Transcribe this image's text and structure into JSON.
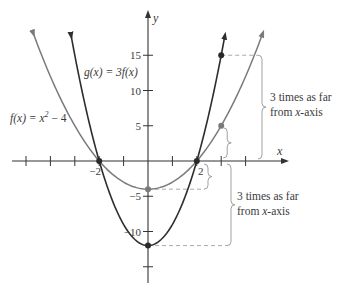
{
  "chart_data": {
    "type": "line",
    "title": "",
    "xlabel": "x",
    "ylabel": "y",
    "xlim": [
      -6,
      7.5
    ],
    "ylim": [
      -17,
      20
    ],
    "x_ticks": [
      -5,
      -4,
      -3,
      -2,
      -1,
      1,
      2,
      3,
      4
    ],
    "x_tick_labels": [
      {
        "value": -2,
        "label": "−2"
      },
      {
        "value": 2,
        "label": "2"
      }
    ],
    "y_ticks": [
      -15,
      -10,
      -5,
      5,
      10,
      15
    ],
    "y_tick_labels": [
      {
        "value": 15,
        "label": "15"
      },
      {
        "value": 10,
        "label": "10"
      },
      {
        "value": 5,
        "label": "5"
      },
      {
        "value": -5,
        "label": "−5"
      },
      {
        "value": -10,
        "label": "−10"
      }
    ],
    "grid": false,
    "series": [
      {
        "name": "f(x) = x² − 4",
        "label_parts": {
          "lhs": "f(x) = x",
          "exp": "2",
          "rhs": " − 4"
        },
        "formula": "x^2 - 4",
        "color": "#7a7a7a",
        "x_range": [
          -4.7,
          4.7
        ],
        "points": [
          [
            -4.7,
            18.09
          ],
          [
            -4,
            12
          ],
          [
            -3,
            5
          ],
          [
            -2,
            0
          ],
          [
            -1,
            -3
          ],
          [
            0,
            -4
          ],
          [
            1,
            -3
          ],
          [
            2,
            0
          ],
          [
            3,
            5
          ],
          [
            4,
            12
          ],
          [
            4.7,
            18.09
          ]
        ]
      },
      {
        "name": "g(x) = 3f(x)",
        "label_parts": {
          "lhs": "g(x) = 3f(x)"
        },
        "formula": "3*(x^2 - 4)",
        "color": "#2e2e2e",
        "x_range": [
          -3.15,
          3.15
        ],
        "points": [
          [
            -3.15,
            17.77
          ],
          [
            -3,
            15
          ],
          [
            -2,
            0
          ],
          [
            -1,
            -9
          ],
          [
            0,
            -12
          ],
          [
            1,
            -9
          ],
          [
            2,
            0
          ],
          [
            3,
            15
          ],
          [
            3.15,
            17.77
          ]
        ]
      }
    ],
    "highlighted_points": [
      {
        "x": -2,
        "y": 0,
        "series": "both"
      },
      {
        "x": 2,
        "y": 0,
        "series": "both"
      },
      {
        "x": 0,
        "y": -4,
        "series": "f"
      },
      {
        "x": 0,
        "y": -12,
        "series": "g"
      },
      {
        "x": 3,
        "y": 5,
        "series": "f"
      },
      {
        "x": 3,
        "y": 15,
        "series": "g"
      }
    ],
    "annotations": [
      {
        "text_line1": "3 times as far",
        "text_line2": "from x-axis",
        "italic_word": "x",
        "refers_to": "x = 3: f(3) = 5 vs g(3) = 15"
      },
      {
        "text_line1": "3 times as far",
        "text_line2": "from x-axis",
        "italic_word": "x",
        "refers_to": "x = 0: f(0) = −4 vs g(0) = −12"
      }
    ]
  }
}
